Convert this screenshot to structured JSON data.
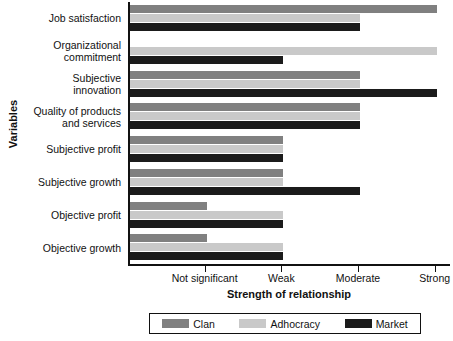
{
  "chart_data": {
    "type": "bar",
    "orientation": "horizontal",
    "title": "",
    "xlabel": "Strength of relationship",
    "ylabel": "Variables",
    "grid": false,
    "legend_position": "bottom",
    "xticklabels": [
      "Not significant",
      "Weak",
      "Moderate",
      "Strong"
    ],
    "xtickvalues": [
      1,
      2,
      3,
      4
    ],
    "xlim": [
      0,
      4.2
    ],
    "categories": [
      "Job satisfaction",
      "Organizational commitment",
      "Subjective innovation",
      "Quality of products and services",
      "Subjective profit",
      "Subjective growth",
      "Objective profit",
      "Objective growth"
    ],
    "series": [
      {
        "name": "Clan",
        "color": "#808080",
        "values": [
          4,
          0,
          3,
          3,
          2,
          2,
          1,
          1
        ]
      },
      {
        "name": "Adhocracy",
        "color": "#c9c9c9",
        "values": [
          3,
          4,
          3,
          3,
          2,
          2,
          2,
          2
        ]
      },
      {
        "name": "Market",
        "color": "#1b1b1b",
        "values": [
          3,
          2,
          4,
          3,
          2,
          3,
          2,
          2
        ]
      }
    ]
  },
  "axis": {
    "y_title": "Variables",
    "x_title": "Strength of relationship",
    "x_ticks": [
      {
        "label": "Not significant"
      },
      {
        "label": "Weak"
      },
      {
        "label": "Moderate"
      },
      {
        "label": "Strong"
      }
    ]
  },
  "categories": [
    {
      "line1": "Job satisfaction",
      "line2": ""
    },
    {
      "line1": "Organizational",
      "line2": "commitment"
    },
    {
      "line1": "Subjective",
      "line2": "innovation"
    },
    {
      "line1": "Quality of products",
      "line2": "and services"
    },
    {
      "line1": "Subjective profit",
      "line2": ""
    },
    {
      "line1": "Subjective growth",
      "line2": ""
    },
    {
      "line1": "Objective profit",
      "line2": ""
    },
    {
      "line1": "Objective growth",
      "line2": ""
    }
  ],
  "legend": [
    {
      "label": "Clan",
      "color": "#808080"
    },
    {
      "label": "Adhocracy",
      "color": "#c9c9c9"
    },
    {
      "label": "Market",
      "color": "#1b1b1b"
    }
  ]
}
